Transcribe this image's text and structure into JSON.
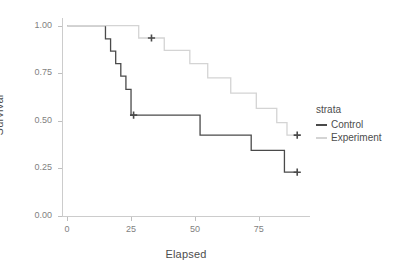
{
  "chart_data": {
    "type": "line",
    "subtype": "kaplan-meier-step",
    "title": "",
    "xlabel": "Elapsed",
    "ylabel": "Survival",
    "xlim": [
      -2,
      95
    ],
    "ylim": [
      0,
      1.04
    ],
    "xticks": [
      0,
      25,
      50,
      75
    ],
    "xtick_labels": [
      "0",
      "25",
      "50",
      "75"
    ],
    "yticks": [
      0.0,
      0.25,
      0.5,
      0.75,
      1.0
    ],
    "ytick_labels": [
      "0.00",
      "0.25",
      "0.50",
      "0.75",
      "1.00"
    ],
    "grid": false,
    "legend": {
      "position": "right",
      "title": "strata",
      "entries": [
        {
          "label": "Control",
          "color": "#4a4a4a"
        },
        {
          "label": "Experiment",
          "color": "#d4d4d4"
        }
      ]
    },
    "series": [
      {
        "name": "Control",
        "color": "#4a4a4a",
        "steps": [
          {
            "x": 0,
            "y": 1.0
          },
          {
            "x": 15,
            "y": 1.0
          },
          {
            "x": 15,
            "y": 0.93
          },
          {
            "x": 17,
            "y": 0.93
          },
          {
            "x": 17,
            "y": 0.866
          },
          {
            "x": 19,
            "y": 0.866
          },
          {
            "x": 19,
            "y": 0.8
          },
          {
            "x": 21,
            "y": 0.8
          },
          {
            "x": 21,
            "y": 0.735
          },
          {
            "x": 23,
            "y": 0.735
          },
          {
            "x": 23,
            "y": 0.665
          },
          {
            "x": 25,
            "y": 0.665
          },
          {
            "x": 25,
            "y": 0.53
          },
          {
            "x": 52,
            "y": 0.53
          },
          {
            "x": 52,
            "y": 0.425
          },
          {
            "x": 72,
            "y": 0.425
          },
          {
            "x": 72,
            "y": 0.345
          },
          {
            "x": 85,
            "y": 0.345
          },
          {
            "x": 85,
            "y": 0.23
          },
          {
            "x": 90,
            "y": 0.23
          }
        ],
        "censors": [
          {
            "x": 26,
            "y": 0.53
          },
          {
            "x": 90,
            "y": 0.23
          }
        ]
      },
      {
        "name": "Experiment",
        "color": "#d4d4d4",
        "steps": [
          {
            "x": 0,
            "y": 1.0
          },
          {
            "x": 28,
            "y": 1.0
          },
          {
            "x": 28,
            "y": 0.935
          },
          {
            "x": 38,
            "y": 0.935
          },
          {
            "x": 38,
            "y": 0.87
          },
          {
            "x": 48,
            "y": 0.87
          },
          {
            "x": 48,
            "y": 0.8
          },
          {
            "x": 55,
            "y": 0.8
          },
          {
            "x": 55,
            "y": 0.725
          },
          {
            "x": 64,
            "y": 0.725
          },
          {
            "x": 64,
            "y": 0.645
          },
          {
            "x": 74,
            "y": 0.645
          },
          {
            "x": 74,
            "y": 0.565
          },
          {
            "x": 82,
            "y": 0.565
          },
          {
            "x": 82,
            "y": 0.49
          },
          {
            "x": 86,
            "y": 0.49
          },
          {
            "x": 86,
            "y": 0.425
          },
          {
            "x": 90,
            "y": 0.425
          }
        ],
        "censors": [
          {
            "x": 33,
            "y": 0.935
          },
          {
            "x": 90,
            "y": 0.425
          }
        ]
      }
    ]
  }
}
